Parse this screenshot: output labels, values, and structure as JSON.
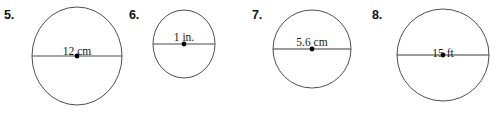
{
  "worksheet": {
    "type": "geometry-exercise-set",
    "topic": "circle-diameter",
    "problems": [
      {
        "number": "5.",
        "shape": "circle",
        "label": "12 cm",
        "value": "12",
        "unit": "cm",
        "measurement": "diameter",
        "geometry": {
          "cx": 46,
          "cy": 54,
          "rx": 45,
          "ry": 49,
          "chord_y": 54
        },
        "stroke_color": "#3a3a3a",
        "line_color": "#4a4a4a",
        "dot_color": "#000000"
      },
      {
        "number": "6.",
        "shape": "circle",
        "label": "1 in.",
        "value": "1",
        "unit": "in.",
        "measurement": "diameter",
        "geometry": {
          "cx": 32,
          "cy": 35,
          "rx": 31,
          "ry": 34,
          "chord_y": 35
        },
        "stroke_color": "#3a3a3a",
        "line_color": "#4a4a4a",
        "dot_color": "#000000"
      },
      {
        "number": "7.",
        "shape": "circle",
        "label": "5.6 cm",
        "value": "5.6",
        "unit": "cm",
        "measurement": "diameter",
        "geometry": {
          "cx": 40,
          "cy": 40,
          "rx": 39,
          "ry": 39,
          "chord_y": 40
        },
        "stroke_color": "#3a3a3a",
        "line_color": "#3a3a3a",
        "dot_color": "#000000"
      },
      {
        "number": "8.",
        "shape": "circle",
        "label": "15 ft",
        "value": "15",
        "unit": "ft",
        "measurement": "diameter",
        "geometry": {
          "cx": 47,
          "cy": 46,
          "rx": 46,
          "ry": 46,
          "chord_y": 46
        },
        "stroke_color": "#3a3a3a",
        "line_color": "#3a3a3a",
        "dot_color": "#000000"
      }
    ]
  }
}
